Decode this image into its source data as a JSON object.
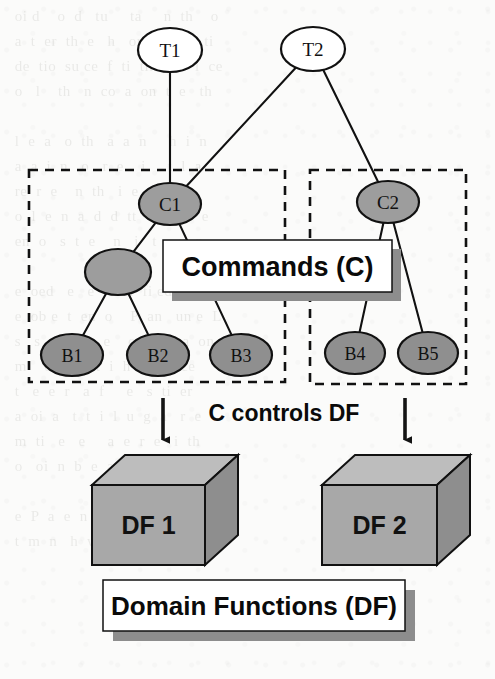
{
  "figure": {
    "name": "command-domain-function-hierarchy",
    "background_color": "#fbfbfa",
    "ink_color": "#111111",
    "node_fill_top": "#ffffff",
    "node_fill_command": "#9d9d9d",
    "node_fill_behaviour": "#8f8f8f",
    "callout_fill": "#ffffff",
    "callout_shadow": "#8d8d8d",
    "cube_front_fill": "#a8a8a8",
    "cube_top_fill": "#bdbdbd",
    "cube_side_fill": "#8e8e8e"
  },
  "tasks": [
    {
      "id": "T1",
      "label": "T1",
      "cx": 170,
      "cy": 50,
      "rx": 32,
      "ry": 22
    },
    {
      "id": "T2",
      "label": "T2",
      "cx": 313,
      "cy": 49,
      "rx": 32,
      "ry": 22
    }
  ],
  "commands": [
    {
      "id": "C1",
      "label": "C1",
      "cx": 170,
      "cy": 204,
      "rx": 31,
      "ry": 21
    },
    {
      "id": "C2",
      "label": "C2",
      "cx": 388,
      "cy": 202,
      "rx": 31,
      "ry": 21
    },
    {
      "id": "Cx",
      "label": "",
      "cx": 118,
      "cy": 272,
      "rx": 33,
      "ry": 23
    }
  ],
  "behaviours": [
    {
      "id": "B1",
      "label": "B1",
      "cx": 72,
      "cy": 355,
      "rx": 31,
      "ry": 21
    },
    {
      "id": "B2",
      "label": "B2",
      "cx": 158,
      "cy": 355,
      "rx": 31,
      "ry": 21
    },
    {
      "id": "B3",
      "label": "B3",
      "cx": 241,
      "cy": 355,
      "rx": 31,
      "ry": 21
    },
    {
      "id": "B4",
      "label": "B4",
      "cx": 355,
      "cy": 353,
      "rx": 30,
      "ry": 21
    },
    {
      "id": "B5",
      "label": "B5",
      "cx": 428,
      "cy": 353,
      "rx": 30,
      "ry": 21
    }
  ],
  "edges": [
    {
      "from": "T1",
      "to": "C1"
    },
    {
      "from": "T2",
      "to": "C1"
    },
    {
      "from": "T2",
      "to": "C2"
    },
    {
      "from": "C1",
      "to": "Cx"
    },
    {
      "from": "C1",
      "to": "B3"
    },
    {
      "from": "Cx",
      "to": "B1"
    },
    {
      "from": "Cx",
      "to": "B2"
    },
    {
      "from": "C2",
      "to": "B4"
    },
    {
      "from": "C2",
      "to": "B5"
    }
  ],
  "dashed_groups": [
    {
      "name": "commands-group-left",
      "x": 29,
      "y": 170,
      "width": 256,
      "height": 212
    },
    {
      "name": "commands-group-right",
      "x": 310,
      "y": 170,
      "width": 156,
      "height": 214
    }
  ],
  "callouts": [
    {
      "name": "commands-callout",
      "label": "Commands (C)",
      "x": 163,
      "y": 240,
      "width": 229,
      "height": 52,
      "font_size": 27,
      "shadow_dx": 9,
      "shadow_dy": 9
    },
    {
      "name": "domain-functions-callout",
      "label": "Domain Functions (DF)",
      "x": 103,
      "y": 580,
      "width": 302,
      "height": 51,
      "font_size": 26,
      "shadow_dx": 10,
      "shadow_dy": 10
    }
  ],
  "annotation": {
    "name": "c-controls-df",
    "label": "C controls DF",
    "x": 284,
    "y": 421
  },
  "arrows": [
    {
      "name": "arrow-to-df1",
      "x": 163,
      "y1": 398,
      "y2": 440
    },
    {
      "name": "arrow-to-df2",
      "x": 405,
      "y1": 398,
      "y2": 440
    }
  ],
  "cubes": [
    {
      "id": "DF1",
      "label": "DF 1",
      "x": 92,
      "y": 485,
      "width": 113,
      "height": 80,
      "depth_x": 33,
      "depth_y": 30
    },
    {
      "id": "DF2",
      "label": "DF 2",
      "x": 322,
      "y": 485,
      "width": 115,
      "height": 80,
      "depth_x": 33,
      "depth_y": 30
    }
  ],
  "bleed_through_text": "  oi d    o  d   tu     ta     n  th    o\n  a  t  er  th  e   h   or   a   ed   ti\n  de  tio  su ce  f  ti  tin    e   i  ce\n  o   l    th   n  co  a  on  t  e   th\n\n  l  e  a   o  th   a  a  n     h  i  n\n  a  a  i  n   o   r  e    i     t  l  a\n  re  r  e    n  th   i  e   e\n  o  l  e  n  a  d  d  tt     ri  de  e\n  en  o   s  t  e    n   i   t     u  n\n\n  e  oed   e   e   l   d  fi ed   s   h\n  e  ob e  t  en  o    P  an   un e  L\n  s   s  t  e   e   e    o  e  to  a  on\n  m    o   t  k  t  i  h   e   n  ce\n  t   e  e  r   a  f     e   s  ti  er\n  a  oi  a   t  t  i  l  u  g  a   r  e\n  m  ti   e   e     a  e  r  e   i  th\n  o   oi  n  b  e  a  i  e  e   n  e\n\n  e  P  a  e  n  o     e   d   l  b  pr\n  t  m  n   h  w  o   r   o  t  e  i\n"
}
